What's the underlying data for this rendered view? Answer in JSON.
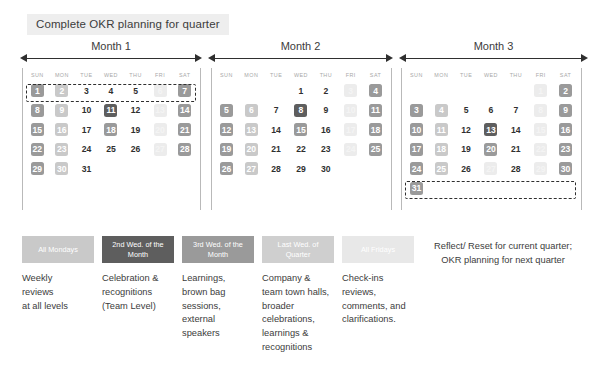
{
  "title": {
    "text": "Complete OKR planning for quarter"
  },
  "dow": [
    "SUN",
    "MON",
    "TUE",
    "WED",
    "THU",
    "FRI",
    "SAT"
  ],
  "months": [
    {
      "label": "Month 1",
      "weeks": [
        [
          {
            "n": "1",
            "tone": "mid"
          },
          {
            "n": "2",
            "tone": "light"
          },
          {
            "n": "3",
            "tone": "none"
          },
          {
            "n": "4",
            "tone": "none"
          },
          {
            "n": "5",
            "tone": "none"
          },
          {
            "n": "6",
            "tone": "pale"
          },
          {
            "n": "7",
            "tone": "mid"
          }
        ],
        [
          {
            "n": "8",
            "tone": "mid"
          },
          {
            "n": "9",
            "tone": "light"
          },
          {
            "n": "10",
            "tone": "none"
          },
          {
            "n": "11",
            "tone": "dark"
          },
          {
            "n": "12",
            "tone": "none"
          },
          {
            "n": "13",
            "tone": "pale"
          },
          {
            "n": "14",
            "tone": "mid"
          }
        ],
        [
          {
            "n": "15",
            "tone": "mid"
          },
          {
            "n": "16",
            "tone": "light"
          },
          {
            "n": "17",
            "tone": "none"
          },
          {
            "n": "18",
            "tone": "mid"
          },
          {
            "n": "19",
            "tone": "none"
          },
          {
            "n": "20",
            "tone": "pale"
          },
          {
            "n": "21",
            "tone": "mid"
          }
        ],
        [
          {
            "n": "22",
            "tone": "mid"
          },
          {
            "n": "23",
            "tone": "light"
          },
          {
            "n": "24",
            "tone": "none"
          },
          {
            "n": "25",
            "tone": "none"
          },
          {
            "n": "26",
            "tone": "none"
          },
          {
            "n": "27",
            "tone": "pale"
          },
          {
            "n": "28",
            "tone": "mid"
          }
        ],
        [
          {
            "n": "29",
            "tone": "mid"
          },
          {
            "n": "30",
            "tone": "light"
          },
          {
            "n": "31",
            "tone": "none"
          },
          {
            "n": "",
            "tone": "empty"
          },
          {
            "n": "",
            "tone": "empty"
          },
          {
            "n": "",
            "tone": "empty"
          },
          {
            "n": "",
            "tone": "empty"
          }
        ]
      ]
    },
    {
      "label": "Month 2",
      "weeks": [
        [
          {
            "n": "",
            "tone": "empty"
          },
          {
            "n": "",
            "tone": "empty"
          },
          {
            "n": "",
            "tone": "empty"
          },
          {
            "n": "1",
            "tone": "none"
          },
          {
            "n": "2",
            "tone": "none"
          },
          {
            "n": "3",
            "tone": "pale"
          },
          {
            "n": "4",
            "tone": "mid"
          }
        ],
        [
          {
            "n": "5",
            "tone": "mid"
          },
          {
            "n": "6",
            "tone": "light"
          },
          {
            "n": "7",
            "tone": "none"
          },
          {
            "n": "8",
            "tone": "dark"
          },
          {
            "n": "9",
            "tone": "none"
          },
          {
            "n": "10",
            "tone": "pale"
          },
          {
            "n": "11",
            "tone": "mid"
          }
        ],
        [
          {
            "n": "12",
            "tone": "mid"
          },
          {
            "n": "13",
            "tone": "light"
          },
          {
            "n": "14",
            "tone": "none"
          },
          {
            "n": "15",
            "tone": "mid"
          },
          {
            "n": "16",
            "tone": "none"
          },
          {
            "n": "17",
            "tone": "pale"
          },
          {
            "n": "18",
            "tone": "mid"
          }
        ],
        [
          {
            "n": "19",
            "tone": "mid"
          },
          {
            "n": "20",
            "tone": "light"
          },
          {
            "n": "21",
            "tone": "none"
          },
          {
            "n": "22",
            "tone": "none"
          },
          {
            "n": "23",
            "tone": "none"
          },
          {
            "n": "24",
            "tone": "pale"
          },
          {
            "n": "25",
            "tone": "mid"
          }
        ],
        [
          {
            "n": "26",
            "tone": "mid"
          },
          {
            "n": "27",
            "tone": "light"
          },
          {
            "n": "28",
            "tone": "none"
          },
          {
            "n": "29",
            "tone": "none"
          },
          {
            "n": "30",
            "tone": "none"
          },
          {
            "n": "",
            "tone": "empty"
          },
          {
            "n": "",
            "tone": "empty"
          }
        ]
      ]
    },
    {
      "label": "Month 3",
      "weeks": [
        [
          {
            "n": "",
            "tone": "empty"
          },
          {
            "n": "",
            "tone": "empty"
          },
          {
            "n": "",
            "tone": "empty"
          },
          {
            "n": "",
            "tone": "empty"
          },
          {
            "n": "",
            "tone": "empty"
          },
          {
            "n": "1",
            "tone": "pale"
          },
          {
            "n": "2",
            "tone": "mid"
          }
        ],
        [
          {
            "n": "3",
            "tone": "mid"
          },
          {
            "n": "4",
            "tone": "light"
          },
          {
            "n": "5",
            "tone": "none"
          },
          {
            "n": "6",
            "tone": "none"
          },
          {
            "n": "7",
            "tone": "none"
          },
          {
            "n": "8",
            "tone": "pale"
          },
          {
            "n": "9",
            "tone": "mid"
          }
        ],
        [
          {
            "n": "10",
            "tone": "mid"
          },
          {
            "n": "11",
            "tone": "light"
          },
          {
            "n": "12",
            "tone": "none"
          },
          {
            "n": "13",
            "tone": "dark"
          },
          {
            "n": "14",
            "tone": "none"
          },
          {
            "n": "15",
            "tone": "pale"
          },
          {
            "n": "16",
            "tone": "mid"
          }
        ],
        [
          {
            "n": "17",
            "tone": "mid"
          },
          {
            "n": "18",
            "tone": "light"
          },
          {
            "n": "19",
            "tone": "none"
          },
          {
            "n": "20",
            "tone": "mid"
          },
          {
            "n": "21",
            "tone": "none"
          },
          {
            "n": "22",
            "tone": "pale"
          },
          {
            "n": "23",
            "tone": "mid"
          }
        ],
        [
          {
            "n": "24",
            "tone": "mid"
          },
          {
            "n": "25",
            "tone": "light"
          },
          {
            "n": "26",
            "tone": "none"
          },
          {
            "n": "27",
            "tone": "pale"
          },
          {
            "n": "28",
            "tone": "none"
          },
          {
            "n": "29",
            "tone": "pale"
          },
          {
            "n": "30",
            "tone": "mid"
          }
        ],
        [
          {
            "n": "31",
            "tone": "mid"
          },
          {
            "n": "",
            "tone": "empty"
          },
          {
            "n": "",
            "tone": "empty"
          },
          {
            "n": "",
            "tone": "empty"
          },
          {
            "n": "",
            "tone": "empty"
          },
          {
            "n": "",
            "tone": "empty"
          },
          {
            "n": "",
            "tone": "empty"
          }
        ]
      ]
    }
  ],
  "legend": [
    {
      "label": "All Mondays",
      "color": "#c9c9c9",
      "desc": "Weekly\nreviews\nat all levels"
    },
    {
      "label": "2nd Wed. of the\nMonth",
      "color": "#5e5e5e",
      "desc": "Celebration &\nrecognitions\n(Team Level)"
    },
    {
      "label": "3rd Wed. of the\nMonth",
      "color": "#9a9a9a",
      "desc": "Learnings,\nbrown bag\nsessions,\nexternal\nspeakers"
    },
    {
      "label": "Last Wed. of\nQuarter",
      "color": "#cfcfcf",
      "desc": "Company &\nteam town halls,\nbroader\ncelebrations,\nlearnings &\nrecognitions"
    },
    {
      "label": "All Fridays",
      "color": "#e8e8e8",
      "desc": "Check-ins\nreviews,\ncomments, and\nclarifications."
    }
  ],
  "reflect_note": {
    "text": "Reflect/ Reset for current quarter; OKR planning for next quarter"
  },
  "colors": {
    "tone_mid": "#9a9a9a",
    "tone_light": "#c9c9c9",
    "tone_pale": "#ececec",
    "tone_dark": "#5e5e5e",
    "ink": "#2f2f2f",
    "banner_bg": "#eeeeee"
  }
}
